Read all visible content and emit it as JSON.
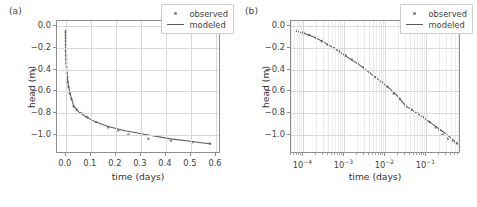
{
  "figure": {
    "panel_a_label": "(a)",
    "panel_b_label": "(b)"
  },
  "legend": {
    "observed_label": "observed",
    "modeled_label": "modeled",
    "observed_color": "#8a8a8a",
    "modeled_color": "#595959"
  },
  "chart_data": [
    {
      "type": "scatter",
      "panel": "(a)",
      "title": "",
      "xlabel": "time (days)",
      "ylabel": "head (m)",
      "xscale": "linear",
      "yscale": "linear",
      "xlim": [
        -0.035,
        0.62
      ],
      "ylim": [
        -1.18,
        0.05
      ],
      "xticks": [
        0.0,
        0.1,
        0.2,
        0.3,
        0.4,
        0.5,
        0.6
      ],
      "xticklabels": [
        "0.0",
        "0.1",
        "0.2",
        "0.3",
        "0.4",
        "0.5",
        "0.6"
      ],
      "yticks": [
        0.0,
        -0.2,
        -0.4,
        -0.6,
        -0.8,
        -1.0
      ],
      "yticklabels": [
        "0.0",
        "-0.2",
        "-0.4",
        "-0.6",
        "-0.8",
        "-1.0"
      ],
      "grid": true,
      "legend_position": "upper right",
      "series": [
        {
          "name": "observed",
          "marker": "point",
          "color": "#8a8a8a",
          "x": [
            7e-05,
            0.0001,
            0.00014,
            0.0002,
            0.00028,
            0.00039,
            0.00055,
            0.00077,
            0.00108,
            0.00151,
            0.00212,
            0.00297,
            0.00416,
            0.00583,
            0.00816,
            0.01143,
            0.01601,
            0.02242,
            0.0314,
            0.04397,
            0.06157,
            0.08622,
            0.12073,
            0.16902,
            0.21,
            0.25,
            0.33,
            0.42,
            0.505,
            0.575
          ],
          "y": [
            -0.042,
            -0.055,
            -0.08,
            -0.105,
            -0.135,
            -0.17,
            -0.2,
            -0.228,
            -0.268,
            -0.305,
            -0.34,
            -0.375,
            -0.43,
            -0.47,
            -0.515,
            -0.56,
            -0.62,
            -0.672,
            -0.74,
            -0.77,
            -0.8,
            -0.838,
            -0.885,
            -0.935,
            -0.962,
            -1.0,
            -1.04,
            -1.058,
            -1.072,
            -1.082
          ]
        },
        {
          "name": "modeled",
          "marker": "line",
          "color": "#595959",
          "x": [
            7e-05,
            0.00012,
            0.0002,
            0.00033,
            0.00055,
            0.00091,
            0.00151,
            0.00251,
            0.00416,
            0.0069,
            0.01143,
            0.01896,
            0.0314,
            0.052,
            0.08622,
            0.12073,
            0.16902,
            0.2366,
            0.33,
            0.42,
            0.505,
            0.58
          ],
          "y": [
            -0.045,
            -0.072,
            -0.105,
            -0.15,
            -0.2,
            -0.255,
            -0.31,
            -0.365,
            -0.43,
            -0.495,
            -0.56,
            -0.635,
            -0.735,
            -0.79,
            -0.845,
            -0.885,
            -0.925,
            -0.965,
            -1.005,
            -1.04,
            -1.065,
            -1.088
          ]
        }
      ]
    },
    {
      "type": "scatter",
      "panel": "(b)",
      "title": "",
      "xlabel": "time (days)",
      "ylabel": "head (m)",
      "xscale": "log",
      "yscale": "linear",
      "xlim": [
        5e-05,
        0.7
      ],
      "ylim": [
        -1.18,
        0.05
      ],
      "xticks": [
        0.0001,
        0.001,
        0.01,
        0.1
      ],
      "xticklabels": [
        "10^-4",
        "10^-3",
        "10^-2",
        "10^-1"
      ],
      "yticks": [
        0.0,
        -0.2,
        -0.4,
        -0.6,
        -0.8,
        -1.0
      ],
      "yticklabels": [
        "0.0",
        "-0.2",
        "-0.4",
        "-0.6",
        "-0.8",
        "-1.0"
      ],
      "grid": true,
      "legend_position": "upper right",
      "series": [
        {
          "name": "observed",
          "marker": "point",
          "color": "#8a8a8a",
          "x": [
            7e-05,
            0.0001,
            0.00014,
            0.0002,
            0.00028,
            0.00039,
            0.00055,
            0.00077,
            0.00108,
            0.00151,
            0.00212,
            0.00297,
            0.00416,
            0.00583,
            0.00816,
            0.01143,
            0.01601,
            0.02242,
            0.0314,
            0.04397,
            0.06157,
            0.08622,
            0.12073,
            0.16902,
            0.21,
            0.25,
            0.33,
            0.42,
            0.505,
            0.575
          ],
          "y": [
            -0.042,
            -0.055,
            -0.08,
            -0.105,
            -0.135,
            -0.17,
            -0.2,
            -0.228,
            -0.268,
            -0.305,
            -0.34,
            -0.375,
            -0.43,
            -0.47,
            -0.515,
            -0.56,
            -0.62,
            -0.672,
            -0.74,
            -0.77,
            -0.8,
            -0.838,
            -0.885,
            -0.935,
            -0.962,
            -1.0,
            -1.04,
            -1.058,
            -1.072,
            -1.082
          ]
        },
        {
          "name": "modeled",
          "marker": "line",
          "color": "#595959",
          "x": [
            7e-05,
            0.00012,
            0.0002,
            0.00033,
            0.00055,
            0.00091,
            0.00151,
            0.00251,
            0.00416,
            0.0069,
            0.01143,
            0.01896,
            0.0314,
            0.052,
            0.08622,
            0.12073,
            0.16902,
            0.2366,
            0.33,
            0.42,
            0.505,
            0.58
          ],
          "y": [
            -0.045,
            -0.072,
            -0.105,
            -0.15,
            -0.2,
            -0.255,
            -0.31,
            -0.365,
            -0.43,
            -0.495,
            -0.56,
            -0.635,
            -0.735,
            -0.79,
            -0.845,
            -0.885,
            -0.925,
            -0.965,
            -1.005,
            -1.04,
            -1.065,
            -1.088
          ]
        }
      ]
    }
  ]
}
